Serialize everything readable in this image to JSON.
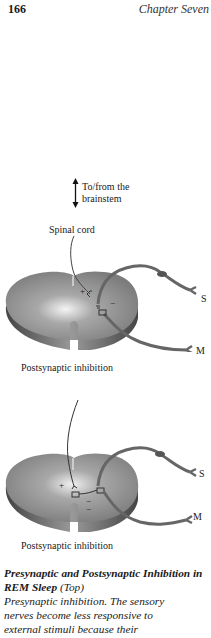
{
  "header": {
    "page_number": "166",
    "running_head": "Chapter Seven"
  },
  "top_label": {
    "icon": "double-arrow-vertical-icon",
    "text": "To/from the\nbrainstem"
  },
  "figure_top": {
    "label_spinal_cord": "Spinal cord",
    "label_s": "S",
    "label_m": "M",
    "sign_plus": "+",
    "sign_minus": "−",
    "caption": "Postsynaptic inhibition"
  },
  "figure_bottom": {
    "label_s": "S",
    "label_m": "M",
    "sign_plus": "+",
    "sign_minus_1": "−",
    "sign_minus_2": "−",
    "caption": "Postsynaptic inhibition"
  },
  "caption": {
    "title": "Presynaptic and Postsynaptic Inhibition in REM Sleep",
    "position_note": "(Top)",
    "body_lines": [
      "Presynaptic inhibition. The sensory",
      "nerves become less responsive to",
      "external stimuli because their"
    ]
  },
  "colors": {
    "cord_fill": "#8a8a8a",
    "cord_highlight": "#e8e8e8",
    "cord_side": "#5a5a5a",
    "nerve": "#6b6b6b"
  }
}
